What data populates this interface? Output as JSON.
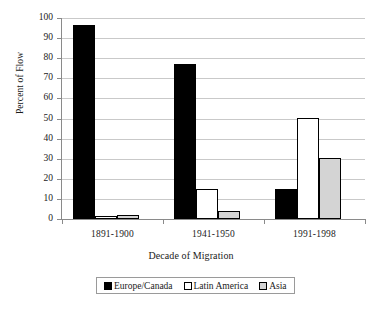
{
  "chart_data": {
    "type": "bar",
    "title": "",
    "xlabel": "Decade of Migration",
    "ylabel": "Percent of Flow",
    "categories": [
      "1891-1900",
      "1941-1950",
      "1991-1998"
    ],
    "series": [
      {
        "name": "Europe/Canada",
        "color": "#000000",
        "values": [
          96.5,
          77.0,
          15.0
        ]
      },
      {
        "name": "Latin America",
        "color": "#ffffff",
        "values": [
          1.3,
          15.0,
          50.5
        ]
      },
      {
        "name": "Asia",
        "color": "#d4d4d4",
        "values": [
          2.2,
          3.8,
          30.5
        ]
      }
    ],
    "ylim": [
      0,
      100
    ],
    "ytick_step": 10,
    "yticks": [
      "100",
      "90",
      "80",
      "70",
      "60",
      "50",
      "40",
      "30",
      "20",
      "10",
      "0"
    ],
    "grid": true,
    "legend_position": "bottom",
    "gridline_color": "#c9c9c9",
    "axis_color": "#8a8a8a",
    "outline_color": "#000000",
    "background": "#ffffff"
  }
}
